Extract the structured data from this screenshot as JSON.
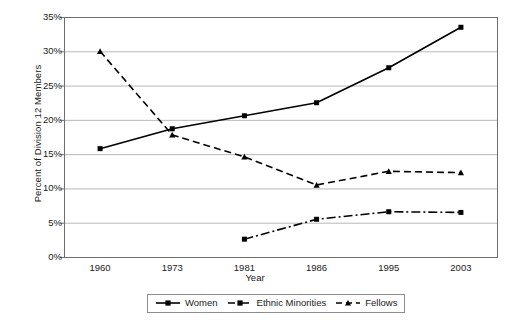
{
  "chart_data": {
    "type": "line",
    "title": "",
    "xlabel": "Year",
    "ylabel": "Percent of Division 12 Members",
    "categories": [
      "1960",
      "1973",
      "1981",
      "1986",
      "1995",
      "2003"
    ],
    "ylim": [
      0,
      35
    ],
    "ytick_labels": [
      "0%",
      "5%",
      "10%",
      "15%",
      "20%",
      "25%",
      "30%",
      "35%"
    ],
    "ytick_values": [
      0,
      5,
      10,
      15,
      20,
      25,
      30,
      35
    ],
    "grid": "horizontal",
    "legend_position": "bottom",
    "series": [
      {
        "name": "Women",
        "values": [
          15.8,
          18.7,
          20.6,
          22.5,
          27.6,
          33.5
        ],
        "color": "#000000",
        "line_style": "solid",
        "marker": "square"
      },
      {
        "name": "Ethnic Minorities",
        "values": [
          null,
          null,
          2.6,
          5.5,
          6.6,
          6.5
        ],
        "color": "#000000",
        "line_style": "dash-dot",
        "marker": "square"
      },
      {
        "name": "Fellows",
        "values": [
          30.0,
          17.8,
          14.6,
          10.5,
          12.5,
          12.3
        ],
        "color": "#000000",
        "line_style": "dashed",
        "marker": "triangle"
      }
    ]
  },
  "legend": {
    "items": [
      {
        "label": "Women"
      },
      {
        "label": "Ethnic Minorities"
      },
      {
        "label": "Fellows"
      }
    ]
  },
  "axes": {
    "y_title": "Percent of Division 12 Members",
    "x_title": "Year"
  },
  "colors": {
    "ink": "#000000",
    "grid": "#b8b8b8",
    "frame": "#6e6e6e",
    "background": "#ffffff"
  }
}
